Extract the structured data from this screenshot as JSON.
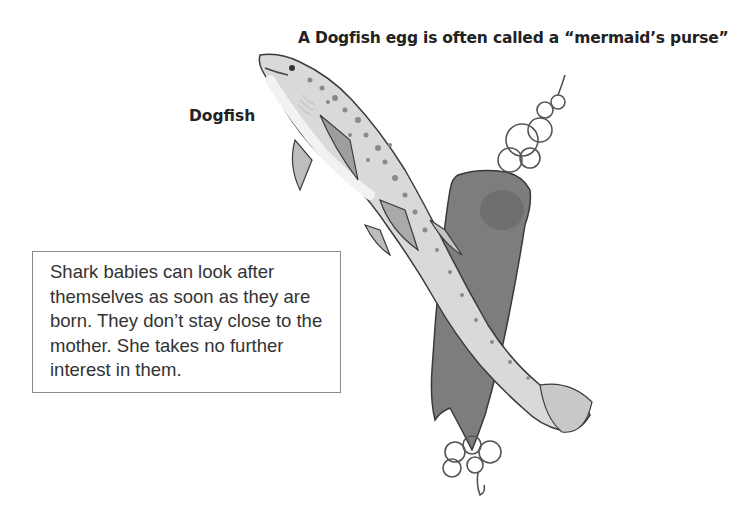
{
  "caption_top": "A Dogfish egg is often called a “mermaid’s purse”",
  "label_dogfish": "Dogfish",
  "textbox": {
    "text": "Shark babies can look after themselves as soon as they are born. They don’t stay close to the mother. She takes no further interest in them."
  },
  "illustration": {
    "subjects": [
      "dogfish-shark",
      "mermaids-purse-egg-case"
    ],
    "colors": {
      "shark_body": "#d9d9d9",
      "shark_belly": "#f2f2f2",
      "spots": "#8a8a8a",
      "egg_case": "#7d7d7d",
      "outline": "#3a3a3a"
    }
  }
}
